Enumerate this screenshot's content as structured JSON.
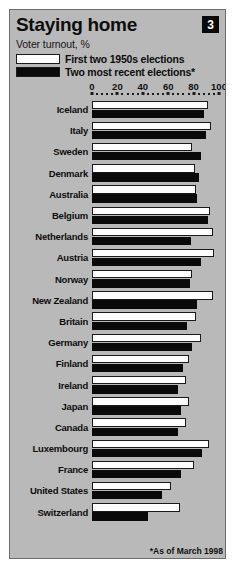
{
  "card": {
    "title": "Staying home",
    "badge": "3",
    "subtitle": "Voter turnout, %",
    "footnote": "*As of March 1998",
    "background_color": "#b9b9b9",
    "border_color": "#6d6d6d"
  },
  "legend": {
    "position": "top-left",
    "entries": [
      {
        "label": "First two 1950s elections",
        "swatch": "white",
        "color": "#fdfdfd"
      },
      {
        "label": "Two most recent elections*",
        "swatch": "black",
        "color": "#0a0a0a"
      }
    ]
  },
  "chart_data": {
    "type": "bar",
    "orientation": "horizontal",
    "title": "Staying home",
    "subtitle": "Voter turnout, %",
    "xlabel": "",
    "ylabel": "",
    "xlim": [
      0,
      100
    ],
    "ticks": [
      0,
      20,
      40,
      60,
      80,
      100
    ],
    "grid": false,
    "legend_position": "top-left",
    "note": "*As of March 1998",
    "categories": [
      "Iceland",
      "Italy",
      "Sweden",
      "Denmark",
      "Australia",
      "Belgium",
      "Netherlands",
      "Austria",
      "Norway",
      "New Zealand",
      "Britain",
      "Germany",
      "Finland",
      "Ireland",
      "Japan",
      "Canada",
      "Luxembourg",
      "France",
      "United States",
      "Switzerland"
    ],
    "series": [
      {
        "name": "First two 1950s elections",
        "color": "#fdfdfd",
        "values": [
          91,
          94,
          79,
          81,
          82,
          93,
          95,
          96,
          79,
          95,
          82,
          86,
          76,
          74,
          76,
          74,
          92,
          80,
          62,
          69
        ]
      },
      {
        "name": "Two most recent elections*",
        "color": "#0a0a0a",
        "values": [
          88,
          90,
          86,
          84,
          83,
          91,
          78,
          86,
          77,
          83,
          75,
          79,
          72,
          68,
          70,
          68,
          87,
          70,
          55,
          44
        ]
      }
    ]
  }
}
